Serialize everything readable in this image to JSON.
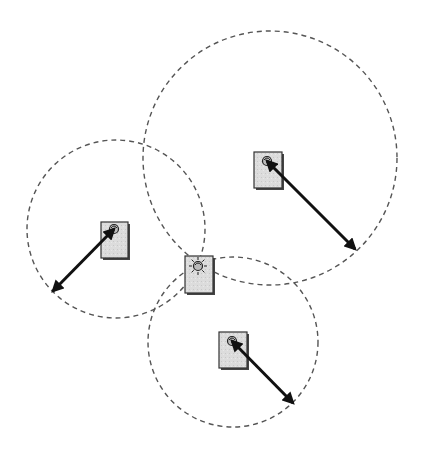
{
  "diagram": {
    "type": "trilateration",
    "width": 423,
    "height": 455,
    "colors": {
      "background": "#ffffff",
      "circle_stroke": "#555555",
      "arrow": "#111111",
      "node_fill": "#dcdcdc",
      "node_border": "#333333",
      "node_shadow": "#444444"
    },
    "range_circles": [
      {
        "id": "anchor-top-right",
        "cx": 270,
        "cy": 158,
        "r": 127
      },
      {
        "id": "anchor-left",
        "cx": 116,
        "cy": 229,
        "r": 89
      },
      {
        "id": "anchor-bottom",
        "cx": 233,
        "cy": 342,
        "r": 85
      }
    ],
    "anchor_nodes": [
      {
        "id": "anchor-left",
        "x": 101,
        "y": 222,
        "w": 27,
        "h": 36,
        "icon": "satellite-dish-icon",
        "dish_x": 114,
        "dish_y": 229
      },
      {
        "id": "anchor-top-right",
        "x": 254,
        "y": 152,
        "w": 28,
        "h": 36,
        "icon": "satellite-dish-icon",
        "dish_x": 267,
        "dish_y": 161
      },
      {
        "id": "anchor-bottom",
        "x": 219,
        "y": 332,
        "w": 28,
        "h": 36,
        "icon": "satellite-dish-icon",
        "dish_x": 232,
        "dish_y": 341
      }
    ],
    "target_node": {
      "id": "unknown-node",
      "x": 185,
      "y": 256,
      "w": 28,
      "h": 37,
      "icon": "signal-source-icon",
      "dish_x": 198,
      "dish_y": 266
    },
    "range_arrows": [
      {
        "from_anchor": "anchor-left",
        "x1": 114,
        "y1": 229,
        "x2": 53,
        "y2": 291,
        "double_headed": true
      },
      {
        "from_anchor": "anchor-top-right",
        "x1": 267,
        "y1": 161,
        "x2": 355,
        "y2": 249,
        "double_headed": true
      },
      {
        "from_anchor": "anchor-bottom",
        "x1": 232,
        "y1": 341,
        "x2": 293,
        "y2": 403,
        "double_headed": true
      }
    ]
  }
}
